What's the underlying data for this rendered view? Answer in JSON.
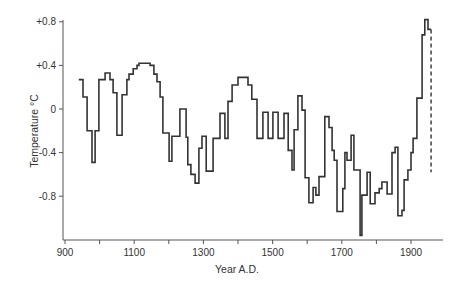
{
  "chart_data": {
    "type": "line",
    "style": "step",
    "title": "",
    "xlabel": "Year A.D.",
    "ylabel": "Temperature °C",
    "xlim": [
      900,
      2000
    ],
    "ylim": [
      -1.2,
      0.8
    ],
    "grid": false,
    "legend": null,
    "x_ticks": [
      900,
      1000,
      1100,
      1200,
      1300,
      1400,
      1500,
      1600,
      1700,
      1800,
      1900
    ],
    "x_tick_labels": [
      "900",
      "",
      "1100",
      "",
      "1300",
      "",
      "1500",
      "",
      "1700",
      "",
      "1900"
    ],
    "y_ticks": [
      0.8,
      0.4,
      0,
      -0.4,
      -0.8
    ],
    "y_tick_labels": [
      "+0.8",
      "+0.4",
      "0",
      "-0.4",
      "-0.8"
    ],
    "series": [
      {
        "name": "Temperature anomaly",
        "color": "#333333",
        "x": [
          940,
          952,
          964,
          978,
          987,
          998,
          1016,
          1030,
          1039,
          1050,
          1065,
          1079,
          1085,
          1097,
          1108,
          1114,
          1146,
          1157,
          1166,
          1175,
          1183,
          1201,
          1209,
          1232,
          1250,
          1255,
          1264,
          1276,
          1287,
          1296,
          1308,
          1328,
          1348,
          1362,
          1371,
          1383,
          1400,
          1429,
          1440,
          1455,
          1472,
          1487,
          1501,
          1516,
          1533,
          1545,
          1556,
          1562,
          1573,
          1585,
          1594,
          1605,
          1617,
          1625,
          1634,
          1651,
          1663,
          1672,
          1678,
          1686,
          1703,
          1709,
          1715,
          1727,
          1735,
          1753,
          1758,
          1773,
          1782,
          1796,
          1808,
          1816,
          1831,
          1845,
          1854,
          1862,
          1874,
          1880,
          1891,
          1900,
          1906,
          1917,
          1932,
          1940,
          1949
        ],
        "values": [
          0.27,
          0.11,
          -0.2,
          -0.49,
          -0.2,
          0.27,
          0.33,
          0.27,
          0.15,
          -0.24,
          0.13,
          0.27,
          0.32,
          0.37,
          0.4,
          0.42,
          0.4,
          0.32,
          0.25,
          0.11,
          -0.22,
          -0.48,
          -0.25,
          0.0,
          -0.26,
          -0.51,
          -0.6,
          -0.68,
          -0.36,
          -0.25,
          -0.57,
          -0.27,
          -0.04,
          -0.27,
          0.07,
          0.22,
          0.29,
          0.22,
          0.09,
          -0.27,
          -0.03,
          -0.27,
          -0.03,
          -0.27,
          -0.04,
          -0.38,
          -0.56,
          -0.19,
          0.12,
          -0.01,
          -0.63,
          -0.86,
          -0.72,
          -0.79,
          -0.62,
          -0.07,
          -0.17,
          -0.38,
          -0.47,
          -0.94,
          -0.73,
          -0.4,
          -0.47,
          -0.24,
          -0.56,
          -1.16,
          -0.79,
          -0.58,
          -0.87,
          -0.77,
          -0.73,
          -0.67,
          -0.78,
          -0.4,
          -0.35,
          -0.98,
          -0.93,
          -0.65,
          -0.56,
          -0.4,
          -0.27,
          0.1,
          0.68,
          0.82,
          0.73
        ],
        "end_year": 1958
      }
    ],
    "annotations": [
      {
        "type": "dashed-vertical-line",
        "x": 1958,
        "y_from": 0.73,
        "y_to": -0.58
      }
    ]
  }
}
